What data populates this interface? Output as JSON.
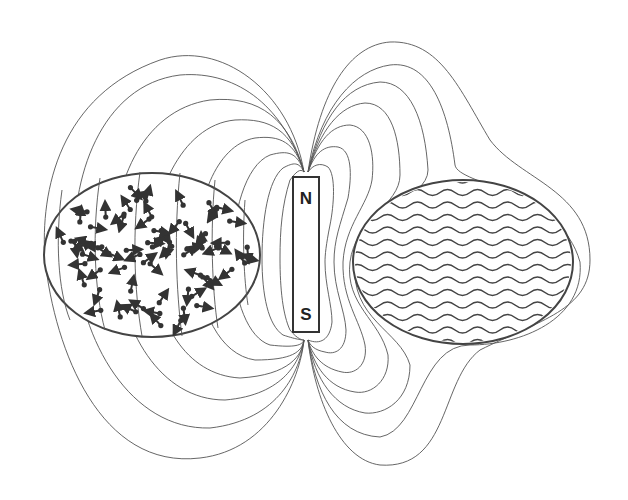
{
  "diagram": {
    "type": "magnetic field lines around bar magnet",
    "magnet": {
      "north_label": "N",
      "south_label": "S"
    },
    "left_region": {
      "description": "randomly oriented magnetic dipoles (arrows with dots)"
    },
    "right_region": {
      "description": "wavy parallel lines (material with aligned structure)"
    },
    "colors": {
      "line": "#555555",
      "background": "#ffffff"
    }
  }
}
